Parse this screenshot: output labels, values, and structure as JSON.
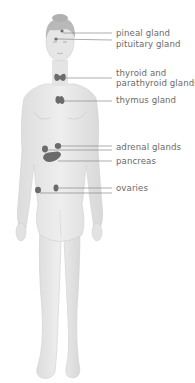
{
  "diagram": {
    "colors": {
      "background": "#ffffff",
      "body_fill": "#e9e9e9",
      "body_shadow": "#d4d4d4",
      "hair": "#b9b9b9",
      "gland": "#6b6b6b",
      "leader_line": "#8a8a8a",
      "label_text": "#6a6a6a"
    },
    "labels": [
      {
        "id": "pineal",
        "text": "pineal gland",
        "y": 29
      },
      {
        "id": "pituitary",
        "text": "pituitary gland",
        "y": 40
      },
      {
        "id": "thyroid_1",
        "text": "thyroid and",
        "y": 69
      },
      {
        "id": "thyroid_2",
        "text": "parathyroid glands",
        "y": 79
      },
      {
        "id": "thymus",
        "text": "thymus gland",
        "y": 95
      },
      {
        "id": "adrenal",
        "text": "adrenal glands",
        "y": 144
      },
      {
        "id": "pancreas",
        "text": "pancreas",
        "y": 157
      },
      {
        "id": "ovaries",
        "text": "ovaries",
        "y": 184
      }
    ]
  }
}
